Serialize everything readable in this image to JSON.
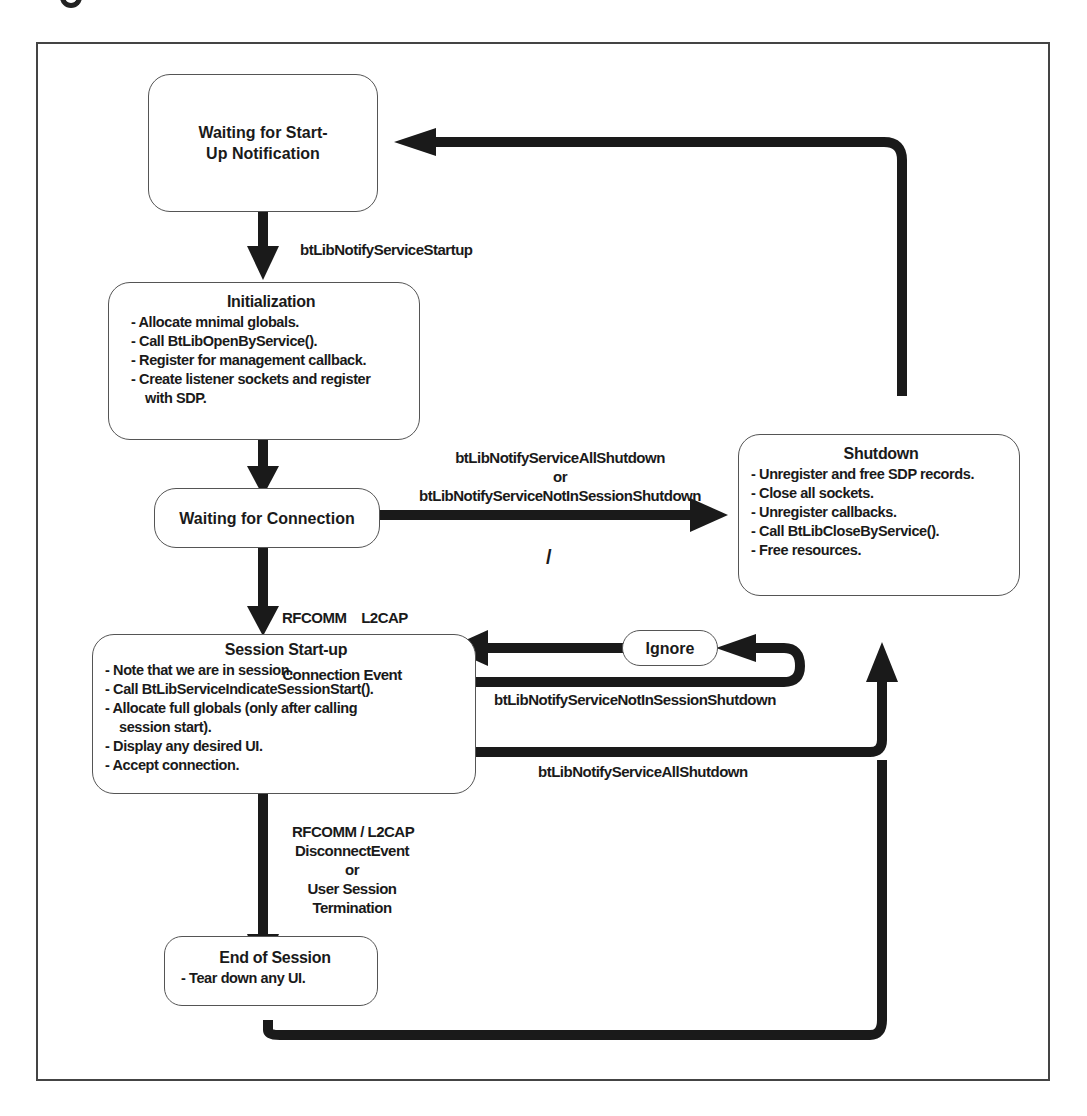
{
  "diagram": {
    "type": "state-flowchart",
    "colors": {
      "edge": "#1a1a1a",
      "node_border": "#555555",
      "frame": "#444444",
      "background": "#ffffff"
    },
    "nodes": {
      "waiting_startup": {
        "title": "Waiting for Start-Up Notification"
      },
      "initialization": {
        "title": "Initialization",
        "items": [
          "Allocate mnimal globals.",
          "Call BtLibOpenByService().",
          "Register for management callback.",
          "Create listener sockets and register with SDP."
        ]
      },
      "waiting_connection": {
        "title": "Waiting for Connection"
      },
      "shutdown": {
        "title": "Shutdown",
        "items": [
          "Unregister and free SDP records.",
          "Close all sockets.",
          "Unregister callbacks.",
          "Call BtLibCloseByService().",
          "Free resources."
        ]
      },
      "session_startup": {
        "title": "Session Start-up",
        "items": [
          "Note that we are in session.",
          "Call BtLibServiceIndicateSessionStart().",
          "Allocate full globals (only after calling session start).",
          "Display any desired UI.",
          "Accept connection."
        ]
      },
      "ignore": {
        "title": "Ignore"
      },
      "end_session": {
        "title": "End of Session",
        "items": [
          "Tear down any UI."
        ]
      }
    },
    "edges": {
      "startup": {
        "label": "btLibNotifyServiceStartup"
      },
      "to_shutdown": {
        "line1": "btLibNotifyServiceAllShutdown",
        "or": "or",
        "line2": "btLibNotifyServiceNotInSessionShutdown"
      },
      "slash": "/",
      "connection_event": {
        "line1": "RFCOMM    L2CAP",
        "line2": "Connection Event"
      },
      "not_in_session": {
        "label": "btLibNotifyServiceNotInSessionShutdown"
      },
      "all_shutdown": {
        "label": "btLibNotifyServiceAllShutdown"
      },
      "disconnect": {
        "line1": "RFCOMM / L2CAP",
        "line2": "DisconnectEvent",
        "or": "or",
        "line3": "User Session",
        "line4": "Termination"
      }
    }
  }
}
